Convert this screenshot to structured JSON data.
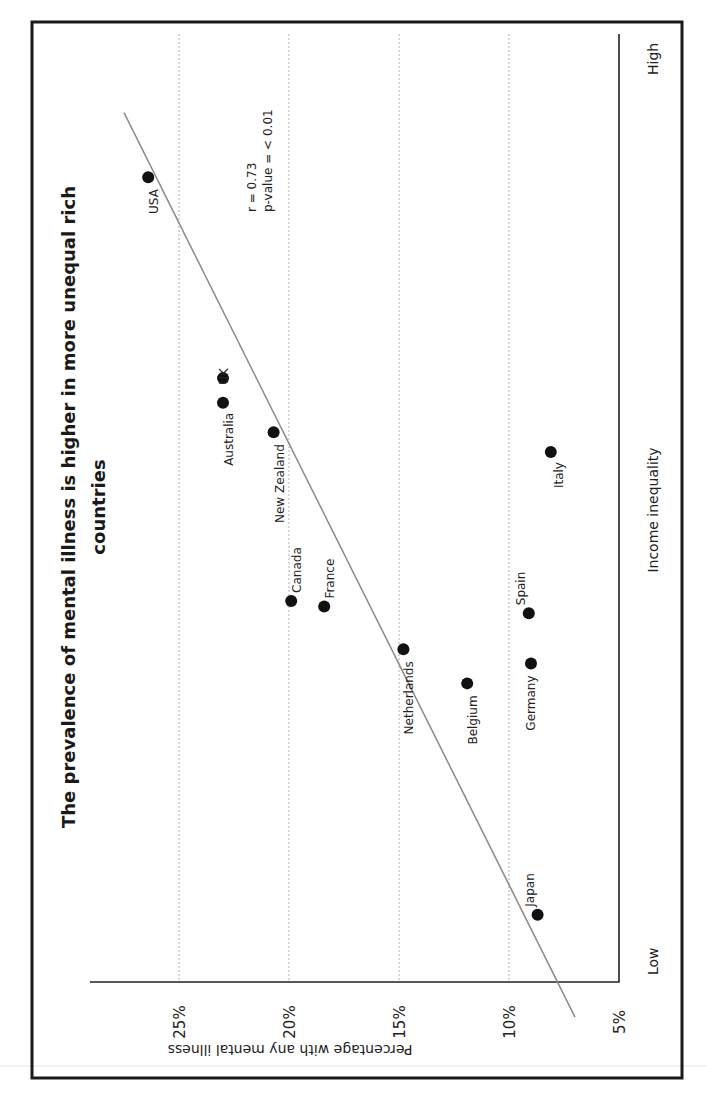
{
  "chart_data": {
    "type": "scatter",
    "title": "The prevalence of mental illness is higher in more unequal rich countries",
    "title_lines": [
      "The prevalence of mental illness is higher in more unequal rich",
      "countries"
    ],
    "xlabel": "Income inequality",
    "ylabel": "Percentage with any mental illness",
    "x_tick_labels": [
      "Low",
      "High"
    ],
    "x_range_note": "ordinal scale from Low to High (values estimated as 0-100 index)",
    "xlim": [
      0,
      100
    ],
    "ylim": [
      5,
      28
    ],
    "y_ticks": [
      5,
      10,
      15,
      20,
      25
    ],
    "y_tick_labels": [
      "5%",
      "10%",
      "15%",
      "20%",
      "25%"
    ],
    "grid": "horizontal dotted at y ticks",
    "orientation": "rotated 90 degrees counter-clockwise",
    "annotations": [
      "r = 0.73",
      "p-value = < 0.01"
    ],
    "trend_line": {
      "x": [
        -3.7,
        91.7
      ],
      "y": [
        7.0,
        27.5
      ]
    },
    "points": [
      {
        "country": "USA",
        "x": 84.9,
        "y": 26.4
      },
      {
        "country": "UK",
        "x": 63.7,
        "y": 23.0
      },
      {
        "country": "Australia",
        "x": 61.1,
        "y": 23.0
      },
      {
        "country": "New Zealand",
        "x": 58.0,
        "y": 20.7
      },
      {
        "country": "Italy",
        "x": 55.9,
        "y": 8.1
      },
      {
        "country": "Canada",
        "x": 40.2,
        "y": 19.9
      },
      {
        "country": "France",
        "x": 39.6,
        "y": 18.4
      },
      {
        "country": "Spain",
        "x": 38.9,
        "y": 9.1
      },
      {
        "country": "Netherlands",
        "x": 35.1,
        "y": 14.8
      },
      {
        "country": "Germany",
        "x": 33.6,
        "y": 9.0
      },
      {
        "country": "Belgium",
        "x": 31.5,
        "y": 11.9
      },
      {
        "country": "Japan",
        "x": 7.1,
        "y": 8.7
      }
    ]
  },
  "labels": {
    "title_line1": "The prevalence of mental illness is higher in more unequal rich",
    "title_line2": "countries",
    "xlabel": "Income inequality",
    "ylabel": "Percentage with any mental illness",
    "x_low": "Low",
    "x_high": "High",
    "stat_r": "r = 0.73",
    "stat_p": "p-value = < 0.01"
  },
  "colors": {
    "dot": "#111111",
    "trend": "#8a8a8a",
    "grid": "#9a9a9a",
    "frame": "#1a1a1a"
  }
}
